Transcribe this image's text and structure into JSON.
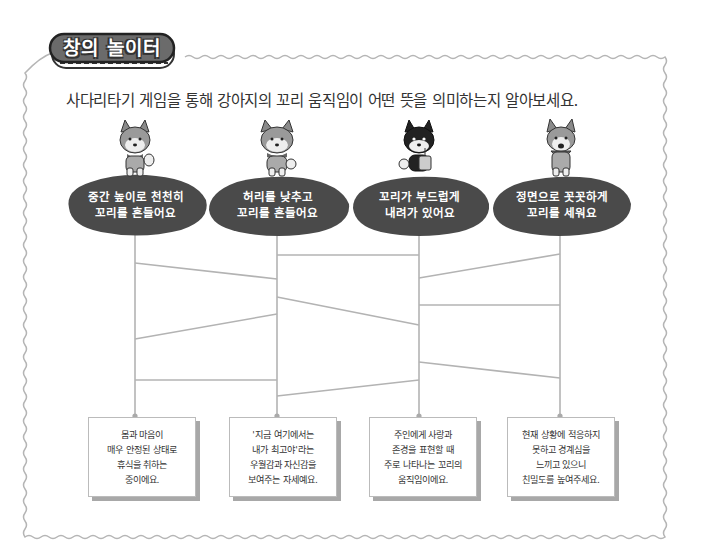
{
  "badge": {
    "title": "창의 놀이터"
  },
  "instruction": "사다리타기 게임을 통해 강아지의 꼬리 움직임이 어떤 뜻을 의미하는지 알아보세요.",
  "colors": {
    "frame": "#b5b5b5",
    "badge_fill": "#6b6b6b",
    "blob_fill": "#4a4a4a",
    "ladder_line": "#b3b3b3",
    "card_shadow": "#a8a8a8"
  },
  "top_items": [
    {
      "dog": "shiba-inu-dog-icon",
      "lines": [
        "중간 높이로 천천히",
        "꼬리를 흔들어요"
      ]
    },
    {
      "dog": "shiba-inu-dog-icon",
      "lines": [
        "허리를 낮추고",
        "꼬리를 흔들어요"
      ]
    },
    {
      "dog": "black-shiba-dog-icon",
      "lines": [
        "꼬리가 부드럽게",
        "내려가 있어요"
      ]
    },
    {
      "dog": "shiba-inu-dog-icon",
      "lines": [
        "정면으로 꼿꼿하게",
        "꼬리를 세워요"
      ]
    }
  ],
  "ladder": {
    "verticals_x": [
      135,
      277,
      419,
      560
    ],
    "top_y": 230,
    "bottom_y": 416,
    "rungs": [
      {
        "from": 0,
        "to": 1,
        "y1": 263,
        "y2": 279
      },
      {
        "from": 0,
        "to": 1,
        "y1": 339,
        "y2": 314
      },
      {
        "from": 0,
        "to": 1,
        "y1": 380,
        "y2": 380
      },
      {
        "from": 1,
        "to": 2,
        "y1": 255,
        "y2": 255
      },
      {
        "from": 1,
        "to": 2,
        "y1": 297,
        "y2": 325
      },
      {
        "from": 1,
        "to": 2,
        "y1": 396,
        "y2": 380
      },
      {
        "from": 2,
        "to": 3,
        "y1": 278,
        "y2": 254
      },
      {
        "from": 2,
        "to": 3,
        "y1": 305,
        "y2": 305
      },
      {
        "from": 2,
        "to": 3,
        "y1": 362,
        "y2": 378
      }
    ]
  },
  "bottom_cards": [
    {
      "lines": [
        "몸과 마음이",
        "매우 안정된 상태로",
        "휴식을 취하는",
        "중이에요."
      ]
    },
    {
      "lines": [
        "'지금 여기에서는",
        "내가 최고야'라는",
        "우월감과 자신감을",
        "보여주는 자세예요."
      ]
    },
    {
      "lines": [
        "주인에게 사랑과",
        "존경을 표현할 때",
        "주로 나타나는 꼬리의",
        "움직임이에요."
      ]
    },
    {
      "lines": [
        "현재 상황에 적응하지",
        "못하고 경계심을",
        "느끼고 있으니",
        "친밀도를 높여주세요."
      ]
    }
  ]
}
